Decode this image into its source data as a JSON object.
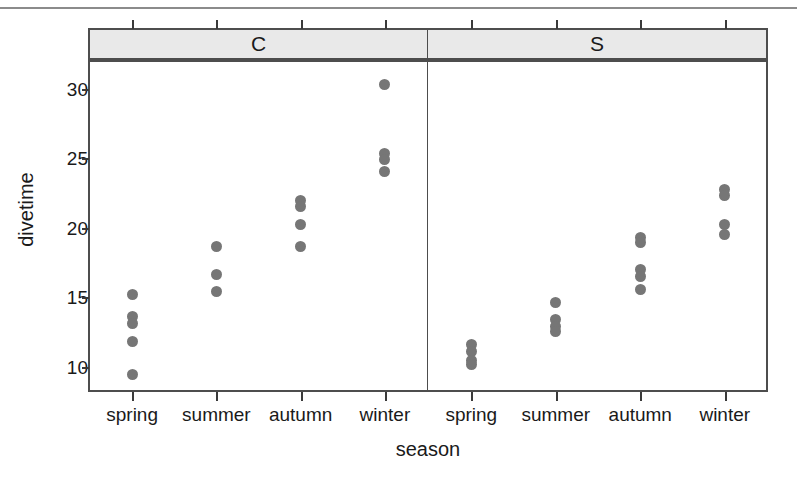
{
  "chart_data": {
    "type": "scatter",
    "title": "",
    "xlabel": "season",
    "ylabel": "divetime",
    "ylim": [
      8.4,
      32.0
    ],
    "yticks": [
      10,
      15,
      20,
      25,
      30
    ],
    "ytick_labels": [
      "10",
      "15",
      "20",
      "25",
      "30"
    ],
    "categories": [
      "spring",
      "summer",
      "autumn",
      "winter"
    ],
    "grid": false,
    "legend": "none",
    "panel_variable": "site",
    "panels": [
      {
        "label": "C",
        "groups": [
          {
            "category": "spring",
            "values": [
              15.3,
              13.7,
              13.2,
              11.9,
              9.5
            ]
          },
          {
            "category": "summer",
            "values": [
              18.7,
              16.7,
              15.5
            ]
          },
          {
            "category": "autumn",
            "values": [
              22.0,
              21.6,
              20.3,
              18.7
            ]
          },
          {
            "category": "winter",
            "values": [
              30.4,
              25.4,
              25.0,
              24.1
            ]
          }
        ]
      },
      {
        "label": "S",
        "groups": [
          {
            "category": "spring",
            "values": [
              11.7,
              11.2,
              10.5,
              10.2
            ]
          },
          {
            "category": "summer",
            "values": [
              14.7,
              13.5,
              13.0,
              12.6
            ]
          },
          {
            "category": "autumn",
            "values": [
              19.4,
              19.0,
              17.1,
              16.6,
              15.6
            ]
          },
          {
            "category": "winter",
            "values": [
              22.8,
              22.4,
              20.3,
              19.6
            ]
          }
        ]
      }
    ],
    "point_color": "#767676",
    "strip_background": "#e9e9e9",
    "frame_color": "#4d4d4d"
  },
  "axes": {
    "y_title": "divetime",
    "x_title": "season"
  },
  "panel_headers": {
    "left": "C",
    "right": "S"
  },
  "x_labels": [
    "spring",
    "summer",
    "autumn",
    "winter",
    "spring",
    "summer",
    "autumn",
    "winter"
  ],
  "y_labels": [
    "30",
    "25",
    "20",
    "15",
    "10"
  ]
}
